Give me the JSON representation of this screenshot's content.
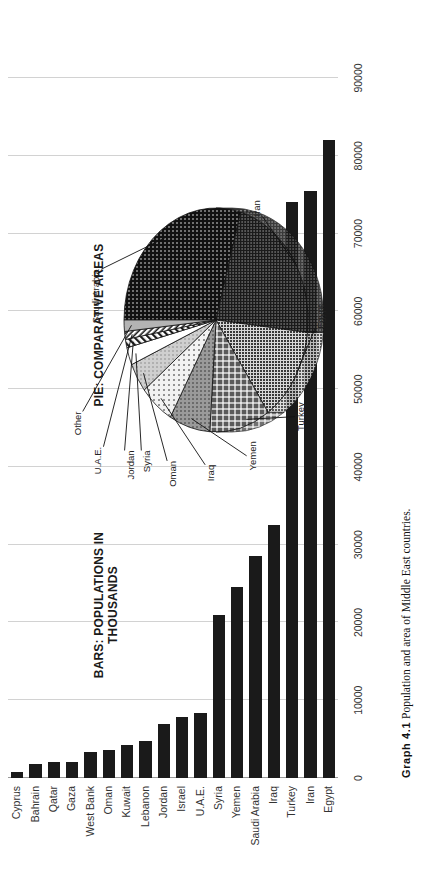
{
  "figure": {
    "caption_number": "Graph 4.1",
    "caption_text": "Population and area of Middle East countries.",
    "bars_title_line1": "BARS: POPULATIONS IN",
    "bars_title_line2": "THOUSANDS",
    "pie_title": "PIE: COMPARATIVE AREAS",
    "bar_color": "#1a1a1a",
    "grid_color": "#d2d2d2"
  },
  "chart_data": [
    {
      "type": "bar",
      "title": "BARS: POPULATIONS IN THOUSANDS",
      "orientation": "vertical",
      "xlabel": "",
      "ylabel": "",
      "ylim": [
        0,
        90000
      ],
      "grid": true,
      "ticks": [
        "0",
        "10000",
        "20000",
        "30000",
        "40000",
        "50000",
        "60000",
        "70000",
        "80000",
        "90000"
      ],
      "tick_values": [
        0,
        10000,
        20000,
        30000,
        40000,
        50000,
        60000,
        70000,
        80000,
        90000
      ],
      "categories": [
        "Cyprus",
        "Bahrain",
        "Qatar",
        "Gaza",
        "West Bank",
        "Oman",
        "Kuwait",
        "Lebanon",
        "Jordan",
        "Israel",
        "U.A.E.",
        "Syria",
        "Yemen",
        "Saudi Arabia",
        "Iraq",
        "Turkey",
        "Iran",
        "Egypt"
      ],
      "values": [
        800,
        1800,
        2000,
        2050,
        3300,
        3600,
        4300,
        4800,
        7000,
        7800,
        8300,
        21000,
        24500,
        28500,
        32500,
        74000,
        75500,
        82000
      ]
    },
    {
      "type": "pie",
      "title": "PIE: COMPARATIVE AREAS",
      "labels": [
        "Saudi Arabia",
        "Iran",
        "Egypt",
        "Turkey",
        "Yemen",
        "Iraq",
        "Oman",
        "Syria",
        "Jordan",
        "U.A.E.",
        "Other"
      ],
      "values": [
        2150,
        1648,
        1001,
        781,
        528,
        438,
        310,
        185,
        89,
        84,
        120
      ],
      "legend": "callout-labels"
    }
  ],
  "pie_slices": [
    {
      "label": "Saudi Arabia",
      "pct": 29.8
    },
    {
      "label": "Iran",
      "pct": 22.8
    },
    {
      "label": "Egypt",
      "pct": 13.9
    },
    {
      "label": "Turkey",
      "pct": 10.8
    },
    {
      "label": "Yemen",
      "pct": 7.3
    },
    {
      "label": "Iraq",
      "pct": 6.1
    },
    {
      "label": "Oman",
      "pct": 4.3
    },
    {
      "label": "Syria",
      "pct": 2.6
    },
    {
      "label": "Jordan",
      "pct": 1.2
    },
    {
      "label": "U.A.E.",
      "pct": 1.2
    },
    {
      "label": "Other",
      "pct": 1.7
    }
  ]
}
